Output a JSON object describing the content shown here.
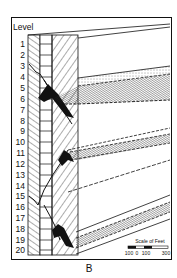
{
  "figure": {
    "panel_label": "B",
    "axis_title": "Level",
    "levels": [
      "1",
      "2",
      "3",
      "4",
      "5",
      "6",
      "7",
      "8",
      "9",
      "10",
      "11",
      "12",
      "13",
      "14",
      "15",
      "16",
      "17",
      "18",
      "19",
      "20"
    ],
    "scale_bar": {
      "title": "Scale of Feet",
      "ticks": [
        "100",
        "0",
        "100",
        "300"
      ]
    }
  },
  "colors": {
    "ink": "#111111",
    "paper": "#ffffff",
    "hatch_fill": "#bdbdbd"
  }
}
